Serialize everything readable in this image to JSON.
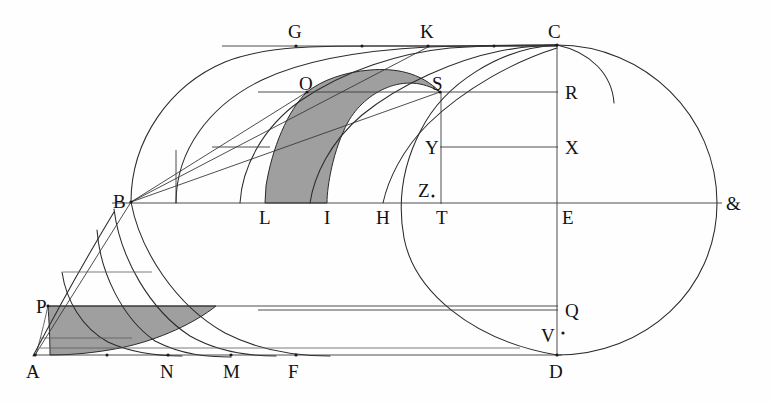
{
  "figure": {
    "background_color": "#fefefe",
    "ink_color": "#2a2a2a",
    "shade_color": "#9a9a9a",
    "width": 771,
    "height": 402
  },
  "labels": [
    {
      "id": "G",
      "text": "G",
      "x": 288,
      "y": 38,
      "role": "curve-point"
    },
    {
      "id": "K",
      "text": "K",
      "x": 420,
      "y": 38,
      "role": "curve-point"
    },
    {
      "id": "C",
      "text": "C",
      "x": 548,
      "y": 38,
      "role": "vertex"
    },
    {
      "id": "O",
      "text": "O",
      "x": 299,
      "y": 90,
      "role": "curve-point"
    },
    {
      "id": "S",
      "text": "S",
      "x": 432,
      "y": 90,
      "role": "curve-point"
    },
    {
      "id": "R",
      "text": "R",
      "x": 565,
      "y": 99,
      "role": "axis-point"
    },
    {
      "id": "Y",
      "text": "Y",
      "x": 425,
      "y": 154,
      "role": "curve-point"
    },
    {
      "id": "X",
      "text": "X",
      "x": 565,
      "y": 154,
      "role": "axis-point"
    },
    {
      "id": "Z",
      "text": "Z",
      "x": 418,
      "y": 197,
      "role": "curve-point"
    },
    {
      "id": "B",
      "text": "B",
      "x": 113,
      "y": 208,
      "role": "vertex"
    },
    {
      "id": "L",
      "text": "L",
      "x": 259,
      "y": 224,
      "role": "base-point"
    },
    {
      "id": "I",
      "text": "I",
      "x": 324,
      "y": 224,
      "role": "base-point"
    },
    {
      "id": "H",
      "text": "H",
      "x": 376,
      "y": 224,
      "role": "base-point"
    },
    {
      "id": "T",
      "text": "T",
      "x": 436,
      "y": 224,
      "role": "base-point"
    },
    {
      "id": "E",
      "text": "E",
      "x": 562,
      "y": 224,
      "role": "center"
    },
    {
      "id": "&",
      "text": "&",
      "x": 726,
      "y": 210,
      "role": "terminus"
    },
    {
      "id": "P",
      "text": "P",
      "x": 36,
      "y": 313,
      "role": "curve-point"
    },
    {
      "id": "Q",
      "text": "Q",
      "x": 565,
      "y": 317,
      "role": "axis-point"
    },
    {
      "id": "V",
      "text": "V",
      "x": 541,
      "y": 342,
      "role": "axis-point"
    },
    {
      "id": "A",
      "text": "A",
      "x": 26,
      "y": 378,
      "role": "vertex"
    },
    {
      "id": "N",
      "text": "N",
      "x": 160,
      "y": 378,
      "role": "base-point"
    },
    {
      "id": "M",
      "text": "M",
      "x": 223,
      "y": 378,
      "role": "base-point"
    },
    {
      "id": "F",
      "text": "F",
      "x": 288,
      "y": 378,
      "role": "base-point"
    },
    {
      "id": "D",
      "text": "D",
      "x": 549,
      "y": 378,
      "role": "vertex"
    }
  ],
  "points": [
    {
      "id": "A",
      "x": 35,
      "y": 355
    },
    {
      "id": "B",
      "x": 131,
      "y": 202
    },
    {
      "id": "C",
      "x": 557,
      "y": 45
    },
    {
      "id": "D",
      "x": 557,
      "y": 355
    },
    {
      "id": "E",
      "x": 557,
      "y": 203
    },
    {
      "id": "amp",
      "x": 717,
      "y": 203
    },
    {
      "id": "G",
      "x": 296,
      "y": 47
    },
    {
      "id": "K",
      "x": 428,
      "y": 47
    },
    {
      "id": "O",
      "x": 307,
      "y": 92
    },
    {
      "id": "S",
      "x": 440,
      "y": 92
    },
    {
      "id": "R",
      "x": 557,
      "y": 92
    },
    {
      "id": "Y",
      "x": 440,
      "y": 147
    },
    {
      "id": "X",
      "x": 557,
      "y": 147
    },
    {
      "id": "Z",
      "x": 432,
      "y": 196
    },
    {
      "id": "T",
      "x": 443,
      "y": 203
    },
    {
      "id": "H",
      "x": 383,
      "y": 203
    },
    {
      "id": "I",
      "x": 327,
      "y": 203
    },
    {
      "id": "L",
      "x": 265,
      "y": 203
    },
    {
      "id": "P",
      "x": 48,
      "y": 305
    },
    {
      "id": "Q",
      "x": 557,
      "y": 310
    },
    {
      "id": "V",
      "x": 557,
      "y": 335
    },
    {
      "id": "N",
      "x": 168,
      "y": 355
    },
    {
      "id": "M",
      "x": 231,
      "y": 355
    },
    {
      "id": "F",
      "x": 296,
      "y": 355
    }
  ],
  "tick_dots": [
    {
      "x": 107,
      "y": 355
    },
    {
      "x": 168,
      "y": 355
    },
    {
      "x": 231,
      "y": 355
    },
    {
      "x": 296,
      "y": 355
    },
    {
      "x": 362,
      "y": 46
    },
    {
      "x": 428,
      "y": 46
    },
    {
      "x": 494,
      "y": 46
    },
    {
      "x": 563,
      "y": 333
    }
  ],
  "axes": {
    "horizontal_axis": {
      "from": "B",
      "to": "&",
      "y": 203,
      "x1": 35,
      "x2": 722
    },
    "vertical_axis": {
      "from": "C",
      "to": "D",
      "x": 557,
      "y1": 45,
      "y2": 355
    },
    "baseline": {
      "from": "A",
      "to": "D",
      "y": 355,
      "x1": 33,
      "x2": 560
    }
  },
  "shaded_regions": [
    {
      "id": "region-OLIS",
      "label": "upper curvilinear strip",
      "corners": [
        "O",
        "L",
        "I",
        "S"
      ],
      "color": "#9a9a9a"
    },
    {
      "id": "region-PAN",
      "label": "lower lune",
      "corners": [
        "P",
        "A",
        "N"
      ],
      "color": "#9a9a9a"
    }
  ],
  "legend": {
    "shaded_note": "shaded",
    "curve_note": "arc"
  }
}
